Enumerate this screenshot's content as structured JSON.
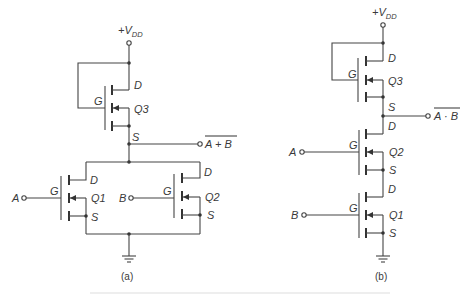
{
  "figure": {
    "panels": [
      {
        "id": "a",
        "caption": "(a)",
        "gate_type": "NOR",
        "supply_label": "+V",
        "supply_sub": "DD",
        "output_label": "A + B",
        "transistors": [
          {
            "name": "Q3",
            "role": "load",
            "labels": {
              "gate": "G",
              "drain": "D",
              "source": "S"
            }
          },
          {
            "name": "Q1",
            "role": "driver",
            "input": "A",
            "labels": {
              "gate": "G",
              "drain": "D",
              "source": "S"
            }
          },
          {
            "name": "Q2",
            "role": "driver",
            "input": "B",
            "labels": {
              "gate": "G",
              "drain": "D",
              "source": "S"
            }
          }
        ],
        "inputs": [
          "A",
          "B"
        ]
      },
      {
        "id": "b",
        "caption": "(b)",
        "gate_type": "NAND",
        "supply_label": "+V",
        "supply_sub": "DD",
        "output_label": "A · B",
        "transistors": [
          {
            "name": "Q3",
            "role": "load",
            "labels": {
              "gate": "G",
              "drain": "D",
              "source": "S"
            }
          },
          {
            "name": "Q2",
            "role": "driver",
            "input": "A",
            "labels": {
              "gate": "G",
              "drain": "D",
              "source": "S"
            }
          },
          {
            "name": "Q1",
            "role": "driver",
            "input": "B",
            "labels": {
              "gate": "G",
              "drain": "D",
              "source": "S"
            }
          }
        ],
        "inputs": [
          "A",
          "B"
        ]
      }
    ],
    "colors": {
      "line": "#444444",
      "background": "#ffffff"
    }
  }
}
